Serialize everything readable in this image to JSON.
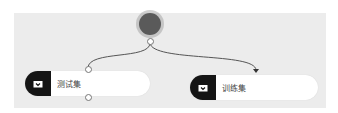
{
  "source_node": {
    "name": "source",
    "color": "#5a5a5a"
  },
  "nodes": [
    {
      "label": "测试集",
      "icon": "dataset-icon"
    },
    {
      "label": "训练集",
      "icon": "dataset-icon"
    }
  ],
  "colors": {
    "canvas": "#ececec",
    "node_icon_bg": "#151515",
    "edge": "#555555"
  }
}
